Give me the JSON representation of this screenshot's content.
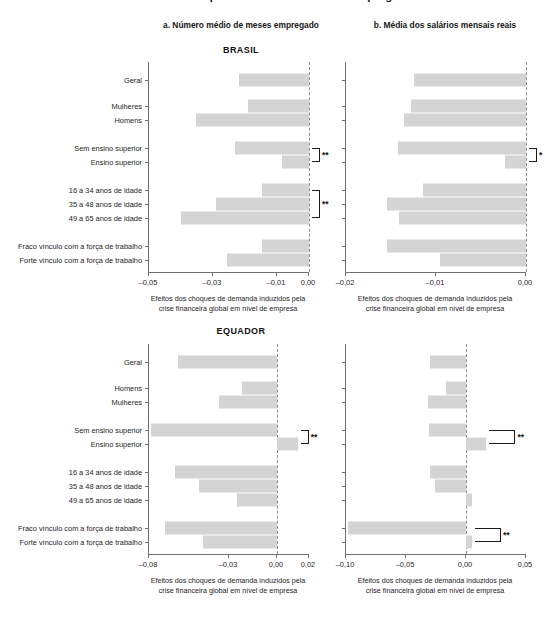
{
  "figure": {
    "clipped_title": "Gráfico: Efeitos dos choques de demanda sobre o emprego e os salários",
    "panel_a_title": "a. Número médio de meses empregado",
    "panel_b_title": "b. Média dos salários mensais reais",
    "axis_caption_line1": "Efeitos dos choques de demanda induzidos pela",
    "axis_caption_line2": "crise financeira global em nível de empresa",
    "bar_color": "#d4d4d4",
    "axis_color": "#6f6f6f",
    "zero_line_color": "#8d8d8d"
  },
  "countries": {
    "brasil": "BRASIL",
    "equador": "EQUADOR"
  },
  "chart_data": [
    {
      "id": "brasil-a",
      "type": "bar",
      "orientation": "horizontal",
      "title": "a. Número médio de meses empregado",
      "panel": "BRASIL",
      "xlabel": "Efeitos dos choques de demanda induzidos pela crise financeira global em nível de empresa",
      "ylabel": "",
      "xlim": [
        -0.05,
        0.0
      ],
      "xticks": [
        -0.05,
        -0.03,
        -0.01,
        0.0
      ],
      "xticklabels": [
        "–0,05",
        "–0,03",
        "–0,01",
        "0,00"
      ],
      "grid": false,
      "zero_line": 0.0,
      "categories": [
        "Geral",
        "Mulheres",
        "Homens",
        "Sem ensino superior",
        "Ensino superior",
        "16 a 34 anos de idade",
        "35 a 48 anos de idade",
        "49 a 65 anos de idade",
        "Fraco vínculo com a força de trabalho",
        "Forte vínculo com a força de trabalho"
      ],
      "values": [
        -0.022,
        -0.0192,
        -0.0352,
        -0.0231,
        -0.0085,
        -0.0146,
        -0.0292,
        -0.0401,
        -0.0147,
        -0.0256
      ],
      "annotations": [
        {
          "label": "**",
          "from": "Sem ensino superior",
          "to": "Ensino superior"
        },
        {
          "label": "**",
          "from": "16 a 34 anos de idade",
          "to": "49 a 65 anos de idade"
        }
      ]
    },
    {
      "id": "brasil-b",
      "type": "bar",
      "orientation": "horizontal",
      "title": "b. Média dos salários mensais reais",
      "panel": "BRASIL",
      "xlabel": "Efeitos dos choques de demanda induzidos pela crise financeira global em nível de empresa",
      "ylabel": "",
      "xlim": [
        -0.02,
        0.0
      ],
      "xticks": [
        -0.02,
        -0.01,
        0.0
      ],
      "xticklabels": [
        "–0,02",
        "–0,01",
        "0,00"
      ],
      "grid": false,
      "zero_line": 0.0,
      "categories": [
        "Geral",
        "Mulheres",
        "Homens",
        "Sem ensino superior",
        "Ensino superior",
        "16 a 34 anos de idade",
        "35 a 48 anos de idade",
        "49 a 65 anos de idade",
        "Fraco vínculo com a força de trabalho",
        "Forte vínculo com a força de trabalho"
      ],
      "values": [
        -0.0124,
        -0.0128,
        -0.0136,
        -0.0142,
        -0.0023,
        -0.0114,
        -0.0154,
        -0.0141,
        -0.0155,
        -0.0096
      ],
      "annotations": [
        {
          "label": "*",
          "from": "Sem ensino superior",
          "to": "Ensino superior"
        }
      ]
    },
    {
      "id": "equador-a",
      "type": "bar",
      "orientation": "horizontal",
      "title": "a. Número médio de meses empregado",
      "panel": "EQUADOR",
      "xlabel": "Efeitos dos choques de demanda induzidos pela crise financeira global em nível de empresa",
      "ylabel": "",
      "xlim": [
        -0.08,
        0.02
      ],
      "xticks": [
        -0.08,
        -0.03,
        0.0,
        0.02
      ],
      "xticklabels": [
        "–0,08",
        "–0,03",
        "0,00",
        "0,02"
      ],
      "grid": false,
      "zero_line": 0.0,
      "categories": [
        "Geral",
        "Homens",
        "Mulheres",
        "Sem ensino superior",
        "Ensino superior",
        "16 a 34 anos de idade",
        "35 a 48 anos de idade",
        "49 a 65 anos de idade",
        "Fraco vínculo com a força de trabalho",
        "Forte vínculo com a força de trabalho"
      ],
      "values": [
        -0.0617,
        -0.022,
        -0.036,
        -0.079,
        0.013,
        -0.064,
        -0.0487,
        -0.025,
        -0.07,
        -0.0463
      ],
      "annotations": [
        {
          "label": "**",
          "from": "Sem ensino superior",
          "to": "Ensino superior"
        }
      ]
    },
    {
      "id": "equador-b",
      "type": "bar",
      "orientation": "horizontal",
      "title": "b. Média dos salários mensais reais",
      "panel": "EQUADOR",
      "xlabel": "Efeitos dos choques de demanda induzidos pela crise financeira global em nível de empresa",
      "ylabel": "",
      "xlim": [
        -0.1,
        0.05
      ],
      "xticks": [
        -0.1,
        -0.05,
        0.0,
        0.05
      ],
      "xticklabels": [
        "–0,10",
        "–0,05",
        "0,00",
        "0,05"
      ],
      "grid": false,
      "zero_line": 0.0,
      "categories": [
        "Geral",
        "Homens",
        "Mulheres",
        "Sem ensino superior",
        "Ensino superior",
        "16 a 34 anos de idade",
        "35 a 48 anos de idade",
        "49 a 65 anos de idade",
        "Fraco vínculo com a força de trabalho",
        "Forte vínculo com a força de trabalho"
      ],
      "values": [
        -0.03,
        -0.0168,
        -0.0318,
        -0.0312,
        0.017,
        -0.03,
        -0.0258,
        0.0048,
        -0.098,
        0.005
      ],
      "annotations": [
        {
          "label": "**",
          "from": "Sem ensino superior",
          "to": "Ensino superior"
        },
        {
          "label": "**",
          "from": "Fraco vínculo com a força de trabalho",
          "to": "Forte vínculo com a força de trabalho"
        }
      ]
    }
  ]
}
